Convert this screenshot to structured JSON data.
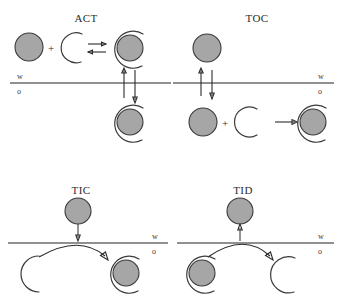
{
  "figure": {
    "title_visible": false,
    "background_color": "#ffffff",
    "ion_color": "#a6a6a6",
    "stroke_color": "#3a3a3a",
    "interface_color": "#6b6b6b"
  },
  "panels": [
    {
      "id": "act",
      "label": "ACT",
      "phase_top_label": "w",
      "phase_bottom_label": "o",
      "plus_symbol": "+",
      "mechanism": "aqueous complexation then transfer",
      "arrows": [
        "equilibrium-right",
        "equilibrium-left",
        "transfer-up",
        "transfer-down"
      ]
    },
    {
      "id": "toc",
      "label": "TOC",
      "phase_top_label": "w",
      "phase_bottom_label": "o",
      "plus_symbol": "+",
      "mechanism": "transfer then organic complexation",
      "arrows": [
        "transfer-up",
        "transfer-down",
        "reaction-right"
      ]
    },
    {
      "id": "tic",
      "label": "TIC",
      "phase_top_label": "w",
      "phase_bottom_label": "o",
      "mechanism": "transfer by interfacial complexation",
      "arrows": [
        "drop-down",
        "interfacial-curve-right"
      ]
    },
    {
      "id": "tid",
      "label": "TID",
      "phase_top_label": "w",
      "phase_bottom_label": "o",
      "mechanism": "transfer by interfacial dissociation",
      "arrows": [
        "rise-up",
        "interfacial-curve-right"
      ]
    }
  ]
}
